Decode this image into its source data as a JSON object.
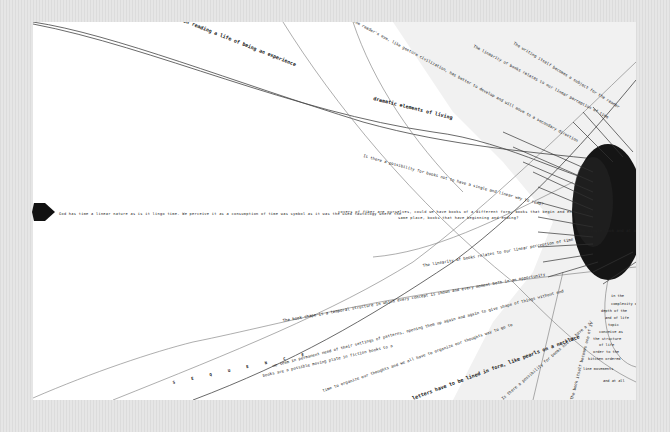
{
  "artwork": {
    "background_color": "#e2e2e2",
    "panel_color": "#ffffff",
    "ink_color": "#111111",
    "shade_color": "#f0f0f0"
  },
  "texts": {
    "top_path_a": "In reading a life of being an experience",
    "top_path_b": "dramatic elements of living",
    "top_reader": "The reader's eye, like gesture civilization, has better to develop and will move to a secondary direction",
    "top_linearity": "The linearity of books relates to our linear perception of time",
    "top_writing": "The writing itself becomes a subject for the reader",
    "mid_left": "God has time a linear nature as is it lingo time. We perceive it as a consumption of time was symbol as it was the used tautology where the",
    "mid_right_1": "covers of fiber are ourselves, could we have books of a different form, books that begin and end at the",
    "mid_right_2": "same place, books that have beginning and ending?",
    "possibility": "Is there a possibility for books not to have a single and linear way to read?",
    "dense_label": "Why single look and at all",
    "linearity_low": "The linearity of books relates to our linear perception of time",
    "book_shape": "The book shape is a temporal structure in which every concept is shown and every moment both in an opportunity",
    "permanent": "we seem in permanent need of their settings of patterns, opening them up again and again to give shape of things without end",
    "organize": "time to organize our thoughts and we all have to organize our thoughts way to go to",
    "books_low": "books are a possible moving plate in fiction books to a book",
    "letters": "letters have to be lined in form, like pearls on a necklace",
    "sequence": "S E Q U E N C E",
    "bottom_q": "Is there a possibility for books not to have a single and linear way to read?",
    "notes": [
      "in the",
      "complexity of",
      "depth of the",
      "and of life",
      "topic",
      "conceive as",
      "the structure",
      "of life",
      "order to the",
      "kitchen ordered",
      "line movements",
      "and at all"
    ],
    "vertical_note": "The book itself becomes one of its content"
  },
  "marker": {
    "shape": "arrow-pentagon",
    "color": "#111111"
  }
}
